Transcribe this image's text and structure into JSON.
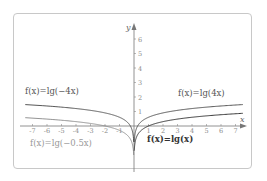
{
  "chart_data": {
    "type": "line",
    "title": "",
    "xlabel": "x",
    "ylabel": "y",
    "xlim": [
      -7.5,
      7.8
    ],
    "ylim": [
      -3.5,
      6.8
    ],
    "grid": false,
    "x_ticks": [
      -7,
      -6,
      -5,
      -4,
      -3,
      -2,
      -1,
      1,
      2,
      3,
      4,
      5,
      6,
      7
    ],
    "x_tick_labels": [
      "-7",
      "-6",
      "-5",
      "-4",
      "-3",
      "-2",
      "-1",
      "1",
      "2",
      "3",
      "4",
      "5",
      "6",
      "7"
    ],
    "y_ticks": [
      1,
      2,
      3,
      4,
      5,
      6
    ],
    "y_tick_labels": [
      "1",
      "2",
      "3",
      "4",
      "5",
      "6"
    ],
    "series": [
      {
        "name": "f(x)=lg(-4x)",
        "domain": [
          -7.5,
          -0.02
        ],
        "formula": "log10(-4x)",
        "color": "#444444",
        "x": [
          -7,
          -5,
          -3,
          -1,
          -0.5,
          -0.25,
          -0.1
        ],
        "y": [
          1.45,
          1.3,
          1.08,
          0.6,
          0.3,
          0.0,
          -0.4
        ]
      },
      {
        "name": "f(x)=lg(-0.5x)",
        "domain": [
          -7.5,
          -0.02
        ],
        "formula": "log10(-0.5x)",
        "color": "#888888",
        "x": [
          -7,
          -5,
          -3,
          -2,
          -1,
          -0.5
        ],
        "y": [
          0.55,
          0.4,
          0.18,
          0.0,
          -0.3,
          -0.6
        ]
      },
      {
        "name": "f(x)=lg(4x)",
        "domain": [
          0.02,
          7.5
        ],
        "formula": "log10(4x)",
        "color": "#444444",
        "x": [
          0.1,
          0.25,
          0.5,
          1,
          3,
          5,
          7
        ],
        "y": [
          -0.4,
          0.0,
          0.3,
          0.6,
          1.08,
          1.3,
          1.45
        ]
      },
      {
        "name": "f(x)=lg(x)",
        "domain": [
          0.02,
          7.5
        ],
        "formula": "log10(x)",
        "color": "#222222",
        "x": [
          0.1,
          0.5,
          1,
          2,
          3,
          5,
          7
        ],
        "y": [
          -1.0,
          -0.3,
          0.0,
          0.3,
          0.48,
          0.7,
          0.85
        ]
      }
    ],
    "annotations": [
      {
        "text": "f(x)=lg(-4x)",
        "position": "upper-left"
      },
      {
        "text": "f(x)=lg(4x)",
        "position": "upper-right"
      },
      {
        "text": "f(x)=lg(-0.5x)",
        "position": "lower-left"
      },
      {
        "text": "f(x)=lg(x)",
        "position": "lower-right"
      }
    ]
  },
  "labels": {
    "f_neg4x": "f(x)=lg(−4x)",
    "f_4x": "f(x)=lg(4x)",
    "f_neg05x": "f(x)=lg(−0.5x)",
    "f_x": "f(x)=lg(x)",
    "x_axis": "x",
    "y_axis": "y"
  }
}
